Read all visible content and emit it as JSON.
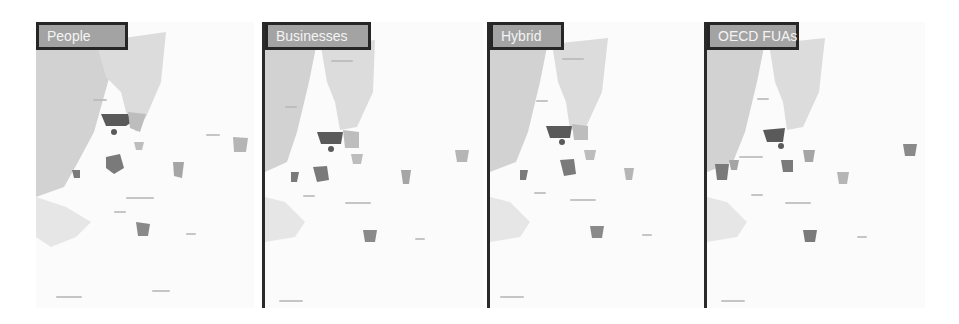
{
  "figure": {
    "panels": [
      {
        "title": "People",
        "left": 36,
        "width": 218,
        "bordered": false
      },
      {
        "title": "Businesses",
        "left": 262,
        "width": 218,
        "bordered": true
      },
      {
        "title": "Hybrid",
        "left": 487,
        "width": 218,
        "bordered": true
      },
      {
        "title": "OECD FUAs",
        "left": 704,
        "width": 218,
        "bordered": true
      }
    ]
  },
  "colors": {
    "sea": "#d2d2d2",
    "land": "#fbfbfb",
    "inland_water": "#dcdcdc",
    "region_dark": "#5a5a5a",
    "region_mid": "#8a8a8a",
    "region_light": "#bdbdbd",
    "title_bg": "#a3a3a3",
    "title_border": "#262626",
    "title_text": "#f4f4f4"
  }
}
